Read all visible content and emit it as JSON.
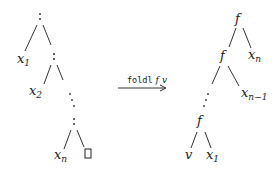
{
  "diagram": {
    "left_tree": {
      "description": "cons list",
      "root": ":",
      "nodes": [
        {
          "id": "cons1",
          "label": ":"
        },
        {
          "id": "x1",
          "label": "x",
          "sub": "1"
        },
        {
          "id": "cons2",
          "label": ":"
        },
        {
          "id": "x2",
          "label": "x",
          "sub": "2"
        },
        {
          "id": "consn",
          "label": ":"
        },
        {
          "id": "xn",
          "label": "x",
          "sub": "n"
        },
        {
          "id": "nil",
          "label": "[]"
        }
      ]
    },
    "arrow": {
      "fn": "foldl",
      "arg1": "f",
      "arg2": "v"
    },
    "right_tree": {
      "description": "left-nested applications of f",
      "nodes": [
        {
          "id": "f_top",
          "label": "f"
        },
        {
          "id": "xn",
          "label": "x",
          "sub": "n"
        },
        {
          "id": "f_second",
          "label": "f"
        },
        {
          "id": "xn1",
          "label": "x",
          "sub": "n−1"
        },
        {
          "id": "f_bottom",
          "label": "f"
        },
        {
          "id": "v",
          "label": "v"
        },
        {
          "id": "x1",
          "label": "x",
          "sub": "1"
        }
      ]
    }
  }
}
